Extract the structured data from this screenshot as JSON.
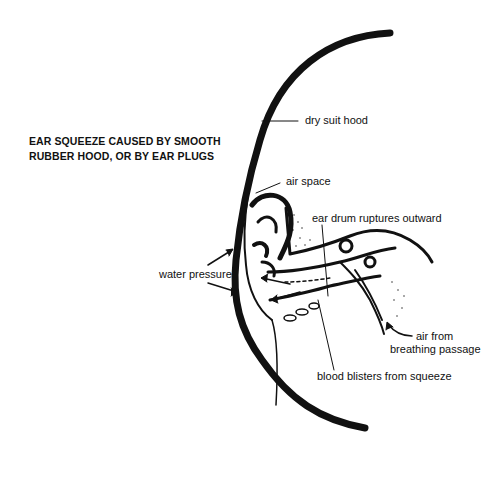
{
  "diagram": {
    "title_lines": [
      "EAR SQUEEZE CAUSED BY SMOOTH",
      "RUBBER HOOD, OR BY EAR PLUGS"
    ],
    "labels": {
      "dry_suit_hood": "dry suit hood",
      "air_space": "air space",
      "ear_drum": "ear drum ruptures outward",
      "water_pressure": "water pressure",
      "air_from": "air from",
      "breathing_passage": "breathing passage",
      "blood_blisters": "blood blisters from squeeze"
    },
    "colors": {
      "ink": "#111111",
      "background": "#ffffff"
    }
  }
}
